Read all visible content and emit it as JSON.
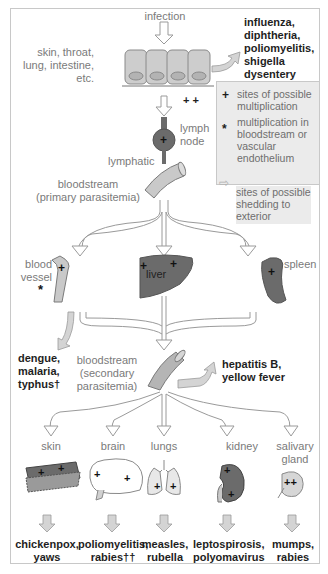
{
  "diagram": {
    "type": "pathogen-spread-flow",
    "entry": {
      "label": "infection",
      "sites": "skin, throat,\nlung, intestine,\netc.",
      "sites_lines": [
        "skin, throat,",
        "lung, intestine,",
        "etc."
      ],
      "shed_diseases_lines": [
        "influenza,",
        "diphtheria,",
        "poliomyelitis,",
        "shigella",
        "dysentery"
      ],
      "marks": "+ +"
    },
    "lymph": {
      "node_label_lines": [
        "lymph",
        "node"
      ],
      "lymphatic_label": "lymphatic",
      "primary_lines": [
        "bloodstream",
        "(primary parasitemia)"
      ]
    },
    "organs": {
      "blood_vessel_lines": [
        "blood",
        "vessel"
      ],
      "blood_vessel_mark": "*",
      "liver": "liver",
      "spleen": "spleen"
    },
    "secondary": {
      "shed_left_lines": [
        "dengue,",
        "malaria,",
        "typhus†"
      ],
      "label_lines": [
        "bloodstream",
        "(secondary",
        "parasitemia)"
      ],
      "shed_right_lines": [
        "hepatitis B,",
        "yellow fever"
      ]
    },
    "targets": [
      {
        "label_lines": [
          "skin"
        ],
        "diseases": [
          "chickenpox,",
          "yaws"
        ]
      },
      {
        "label_lines": [
          "brain"
        ],
        "diseases": [
          "poliomyelitis,",
          "rabies††"
        ]
      },
      {
        "label_lines": [
          "lungs"
        ],
        "diseases": [
          "measles,",
          "rubella"
        ]
      },
      {
        "label_lines": [
          "kidney"
        ],
        "diseases": [
          "leptospirosis,",
          "polyomavirus"
        ]
      },
      {
        "label_lines": [
          "salivary",
          "gland"
        ],
        "diseases": [
          "mumps,",
          "rabies"
        ]
      }
    ],
    "legend": [
      {
        "symbol": "+",
        "icon": "plus-icon",
        "lines": [
          "sites of possible",
          "multiplication"
        ]
      },
      {
        "symbol": "*",
        "icon": "asterisk-icon",
        "lines": [
          "multiplication in",
          "bloodstream or",
          "vascular",
          "endothelium"
        ]
      },
      {
        "symbol": "⇨",
        "icon": "shedding-arrow-icon",
        "lines": [
          "sites of possible",
          "shedding to",
          "exterior"
        ]
      }
    ],
    "colors": {
      "tissue_light": "#c9c9c9",
      "organ_dark": "#6b6b6b",
      "shed_arrow": "#d4d4d4",
      "legend_bg": "#ebebeb",
      "text_gray": "#7a7a7a",
      "text_bold": "#1e1e1e"
    }
  }
}
